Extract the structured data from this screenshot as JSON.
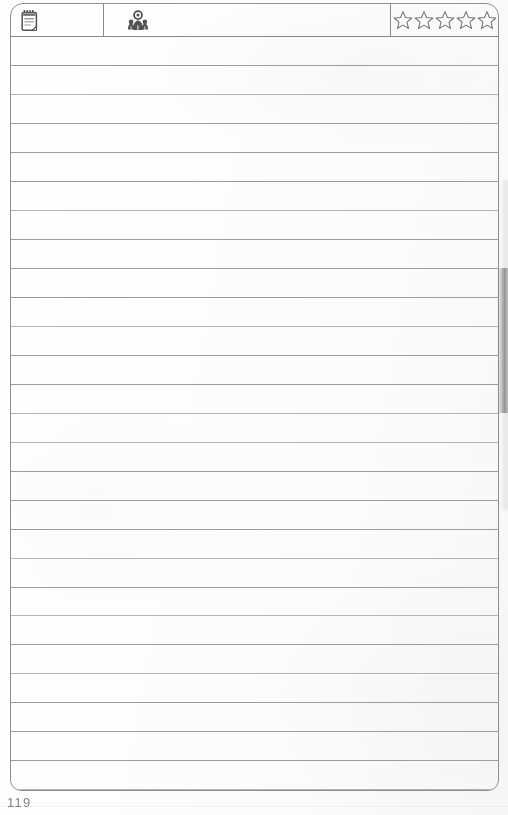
{
  "document": {
    "kind": "scanned-journal-page",
    "page_number": "119"
  },
  "header": {
    "date_cell": {
      "icon": "notepad-icon",
      "value": ""
    },
    "title_cell": {
      "icon": "people-icon",
      "value": ""
    },
    "rating": {
      "icon": "star-icon",
      "max": 5,
      "selected": 0,
      "stars": [
        {
          "index": 1,
          "filled": false
        },
        {
          "index": 2,
          "filled": false
        },
        {
          "index": 3,
          "filled": false
        },
        {
          "index": 4,
          "filled": false
        },
        {
          "index": 5,
          "filled": false
        }
      ]
    }
  },
  "body": {
    "line_count": 26,
    "lines": [
      {
        "index": 1,
        "text": ""
      },
      {
        "index": 2,
        "text": ""
      },
      {
        "index": 3,
        "text": ""
      },
      {
        "index": 4,
        "text": ""
      },
      {
        "index": 5,
        "text": ""
      },
      {
        "index": 6,
        "text": ""
      },
      {
        "index": 7,
        "text": ""
      },
      {
        "index": 8,
        "text": ""
      },
      {
        "index": 9,
        "text": ""
      },
      {
        "index": 10,
        "text": ""
      },
      {
        "index": 11,
        "text": ""
      },
      {
        "index": 12,
        "text": ""
      },
      {
        "index": 13,
        "text": ""
      },
      {
        "index": 14,
        "text": ""
      },
      {
        "index": 15,
        "text": ""
      },
      {
        "index": 16,
        "text": ""
      },
      {
        "index": 17,
        "text": ""
      },
      {
        "index": 18,
        "text": ""
      },
      {
        "index": 19,
        "text": ""
      },
      {
        "index": 20,
        "text": ""
      },
      {
        "index": 21,
        "text": ""
      },
      {
        "index": 22,
        "text": ""
      },
      {
        "index": 23,
        "text": ""
      },
      {
        "index": 24,
        "text": ""
      },
      {
        "index": 25,
        "text": ""
      },
      {
        "index": 26,
        "text": ""
      }
    ]
  },
  "colors": {
    "paper": "#fefefe",
    "border": "#8b8f93",
    "rule": "#9b9ea1",
    "ink": "#2b2b2b",
    "page_number": "#6d7073",
    "star_outline": "#6f7276"
  }
}
